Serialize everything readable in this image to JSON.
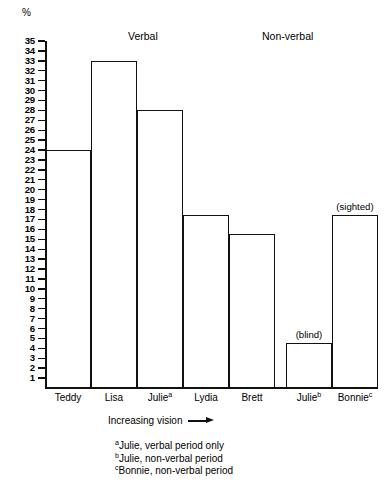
{
  "chart_data": {
    "type": "bar",
    "title": "",
    "ylabel": "%",
    "xlabel": "Increasing vision",
    "ylim": [
      0,
      35
    ],
    "grid": false,
    "legend": "none",
    "axis_note": "Y axis ticks every 1 unit from 1 to 35; bar outlines only (unfilled)",
    "categories": [
      "Teddy",
      "Lisa",
      "Julie",
      "Lydia",
      "Brett",
      "Julie",
      "Bonnie"
    ],
    "category_labels": [
      "Teddy",
      "Lisa",
      "Julieᵃ",
      "Lydia",
      "Brett",
      "Julieᵇ",
      "Bonnieᶜ"
    ],
    "values": [
      24,
      33,
      28,
      17.5,
      15.5,
      4.5,
      17.5
    ],
    "groups": [
      {
        "name": "Verbal",
        "categories": [
          "Teddy",
          "Lisa",
          "Julie",
          "Lydia",
          "Brett"
        ]
      },
      {
        "name": "Non-verbal",
        "categories": [
          "Julie",
          "Bonnie"
        ]
      }
    ],
    "annotations": [
      {
        "text": "(blind)",
        "category": "Julieᵇ",
        "value": 4.5
      },
      {
        "text": "(sighted)",
        "category": "Bonnieᶜ",
        "value": 17.5
      }
    ]
  },
  "axis": {
    "y_unit_label": "%",
    "y_ticks": [
      35,
      34,
      33,
      32,
      31,
      30,
      29,
      28,
      27,
      26,
      25,
      24,
      23,
      22,
      21,
      20,
      19,
      18,
      17,
      16,
      15,
      14,
      13,
      12,
      11,
      10,
      9,
      8,
      7,
      6,
      5,
      4,
      3,
      2,
      1
    ]
  },
  "headers": {
    "verbal": "Verbal",
    "non_verbal": "Non-verbal"
  },
  "bars": [
    {
      "label": "Teddy",
      "sup": "",
      "value": 24,
      "note": ""
    },
    {
      "label": "Lisa",
      "sup": "",
      "value": 33,
      "note": ""
    },
    {
      "label": "Julie",
      "sup": "a",
      "value": 28,
      "note": ""
    },
    {
      "label": "Lydia",
      "sup": "",
      "value": 17.5,
      "note": ""
    },
    {
      "label": "Brett",
      "sup": "",
      "value": 15.5,
      "note": ""
    },
    {
      "label": "Julie",
      "sup": "b",
      "value": 4.5,
      "note": "(blind)"
    },
    {
      "label": "Bonnie",
      "sup": "c",
      "value": 17.5,
      "note": "(sighted)"
    }
  ],
  "caption": {
    "increasing_vision": "Increasing vision"
  },
  "footnotes": [
    {
      "marker": "a",
      "text": "Julie, verbal period only"
    },
    {
      "marker": "b",
      "text": "Julie, non-verbal period"
    },
    {
      "marker": "c",
      "text": "Bonnie, non-verbal period"
    }
  ],
  "colors": {
    "ink": "#111111",
    "background": "#ffffff"
  }
}
